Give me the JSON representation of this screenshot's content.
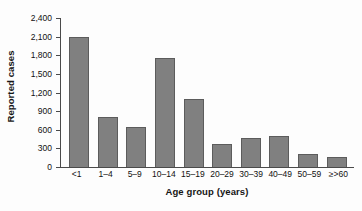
{
  "chart_data": {
    "type": "bar",
    "title": "",
    "subtitle": "",
    "xlabel": "Age group (years)",
    "ylabel": "Reported cases",
    "categories": [
      "<1",
      "1–4",
      "5–9",
      "10–14",
      "15–19",
      "20–29",
      "30–39",
      "40–49",
      "50–59",
      "≥>60"
    ],
    "values": [
      2100,
      805,
      640,
      1750,
      1100,
      370,
      465,
      500,
      210,
      165
    ],
    "ylim": [
      0,
      2400
    ],
    "ytick_values": [
      0,
      300,
      600,
      900,
      1200,
      1500,
      1800,
      2100,
      2400
    ],
    "ytick_labels": [
      "0",
      "300",
      "600",
      "900",
      "1,200",
      "1,500",
      "1,800",
      "2,100",
      "2,400"
    ],
    "grid": false,
    "legend": "none",
    "bar_color": "#808080",
    "bar_edge_color": "#5c5c5c",
    "axis_color": "#4a4a4a",
    "background_color": "#fdfdfd"
  }
}
